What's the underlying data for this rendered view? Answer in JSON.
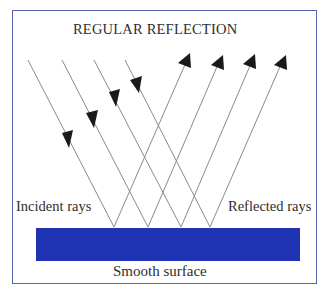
{
  "title": "REGULAR REFLECTION",
  "labels": {
    "incident": "Incident rays",
    "reflected": "Reflected rays",
    "surface": "Smooth surface"
  },
  "colors": {
    "frame": "#5a64b4",
    "surface": "#1e33b4",
    "ray": "#8a8a8a",
    "arrow": "#1a1a1a",
    "text": "#2e2e2e"
  },
  "rays": {
    "count": 4,
    "incident_starts": [
      [
        28,
        60
      ],
      [
        62,
        60
      ],
      [
        94,
        60
      ],
      [
        125,
        60
      ]
    ],
    "reflection_points": [
      [
        114,
        227
      ],
      [
        148,
        227
      ],
      [
        181,
        227
      ],
      [
        210,
        227
      ]
    ],
    "reflected_ends": [
      [
        190,
        53
      ],
      [
        222,
        55
      ],
      [
        255,
        54
      ],
      [
        285,
        55
      ]
    ]
  }
}
